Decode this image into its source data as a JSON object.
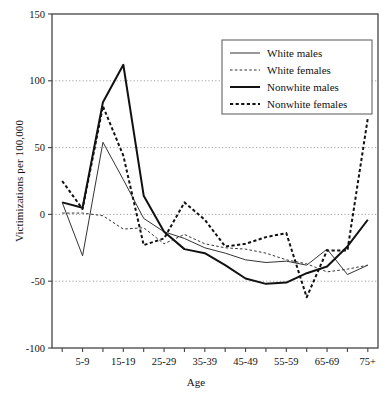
{
  "chart_data": {
    "type": "line",
    "title": "",
    "xlabel": "Age",
    "ylabel": "Victimizations per 100,000",
    "ylim": [
      -100,
      150
    ],
    "yticks": [
      -100,
      -50,
      0,
      50,
      100,
      150
    ],
    "ytick_labels": [
      "-100",
      "-50",
      "0",
      "50",
      "100",
      "150"
    ],
    "grid": true,
    "grid_axis": "y",
    "legend_position": "top-right",
    "categories": [
      "0-4",
      "5-9",
      "10-14",
      "15-19",
      "20-24",
      "25-29",
      "30-34",
      "35-39",
      "40-44",
      "45-49",
      "50-54",
      "55-59",
      "60-64",
      "65-69",
      "70-74",
      "75+"
    ],
    "xtick_labels": [
      "5-9",
      "15-19",
      "25-29",
      "35-39",
      "45-49",
      "55-59",
      "65-69",
      "75+"
    ],
    "xtick_indices": [
      1,
      3,
      5,
      7,
      9,
      11,
      13,
      15
    ],
    "series": [
      {
        "name": "White males",
        "style": "solid",
        "width": 1,
        "color": "#333333",
        "values": [
          9,
          -31,
          54,
          26,
          -3,
          -13,
          -18,
          -25,
          -29,
          -34,
          -36,
          -35,
          -38,
          -26,
          -45,
          -38
        ]
      },
      {
        "name": "White females",
        "style": "dashed",
        "width": 1,
        "color": "#333333",
        "values": [
          1,
          1,
          -1,
          -11,
          -10,
          -22,
          -15,
          -22,
          -25,
          -26,
          -29,
          -34,
          -37,
          -43,
          -41,
          -38
        ]
      },
      {
        "name": "Nonwhite males",
        "style": "solid",
        "width": 2,
        "color": "#111111",
        "values": [
          9,
          5,
          84,
          112,
          14,
          -13,
          -26,
          -29,
          -38,
          -48,
          -52,
          -51,
          -44,
          -39,
          -24,
          -4
        ]
      },
      {
        "name": "Nonwhite females",
        "style": "dashed",
        "width": 2,
        "color": "#111111",
        "values": [
          25,
          4,
          81,
          44,
          -23,
          -18,
          9,
          -4,
          -24,
          -22,
          -17,
          -14,
          -62,
          -27,
          -27,
          72
        ]
      }
    ]
  },
  "legend": {
    "entries": [
      {
        "label": "White males"
      },
      {
        "label": "White females"
      },
      {
        "label": "Nonwhite males"
      },
      {
        "label": "Nonwhite females"
      }
    ]
  }
}
